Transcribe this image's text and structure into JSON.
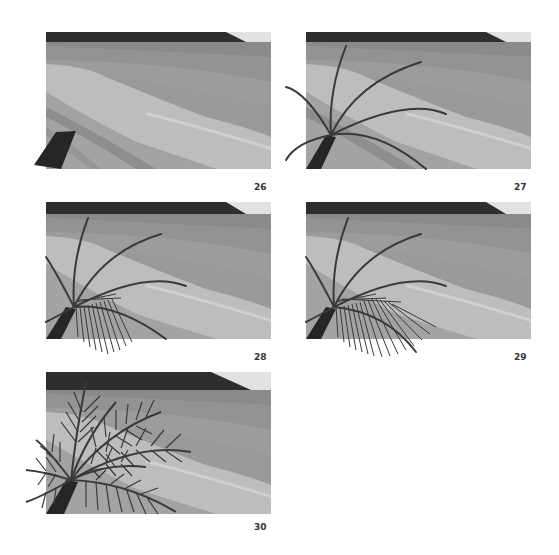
{
  "figure": {
    "panels": [
      {
        "step": "26",
        "fronds": 0,
        "leaflets": "none",
        "trunk_only": true
      },
      {
        "step": "27",
        "fronds": 7,
        "leaflets": "none"
      },
      {
        "step": "28",
        "fronds": 7,
        "leaflets": "one-frond-partial"
      },
      {
        "step": "29",
        "fronds": 7,
        "leaflets": "one-frond-full"
      },
      {
        "step": "30",
        "fronds": 9,
        "leaflets": "all"
      }
    ],
    "colors": {
      "hills": "#2e2e2e",
      "sky": "#e2e2e2",
      "sea_far": "#8a8a8a",
      "sea_mid": "#9c9c9c",
      "sea_near": "#a6a6a6",
      "sand_light": "#bdbdbd",
      "sand_highlight": "#d0d0d0",
      "shore_dark": "#8e8e8e",
      "palm": "#3a3a3a",
      "trunk": "#262626"
    }
  }
}
